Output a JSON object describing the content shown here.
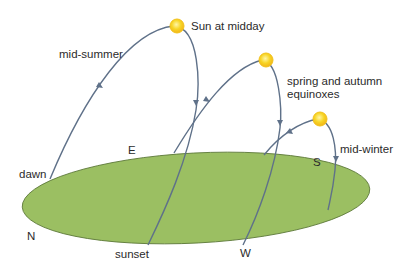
{
  "diagram": {
    "colors": {
      "ground": "#9bbf62",
      "ground_edge": "#5d7a3a",
      "path": "#5f7189",
      "sun": "#f5d020",
      "sun_halo": "#f8b81c",
      "text": "#2b2b2b"
    },
    "labels": {
      "sun_at_midday": "Sun at midday",
      "mid_summer": "mid-summer",
      "equinoxes_line1": "spring and autumn",
      "equinoxes_line2": "equinoxes",
      "mid_winter": "mid-winter",
      "dawn": "dawn",
      "sunset": "sunset"
    },
    "compass": {
      "north": "N",
      "east": "E",
      "south": "S",
      "west": "W"
    },
    "paths": [
      {
        "name": "mid-summer",
        "sun_position": "highest"
      },
      {
        "name": "spring and autumn equinoxes",
        "sun_position": "middle"
      },
      {
        "name": "mid-winter",
        "sun_position": "lowest"
      }
    ]
  }
}
